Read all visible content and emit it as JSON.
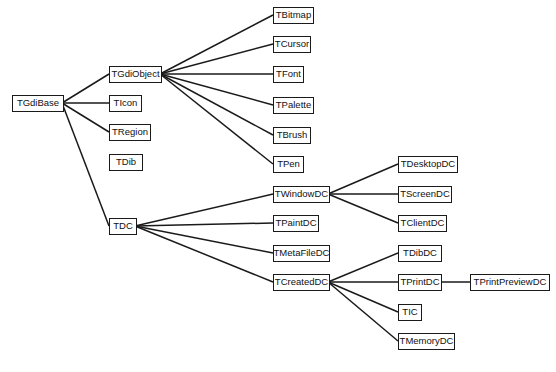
{
  "diagram": {
    "type": "class-hierarchy",
    "nodes": [
      {
        "id": "TGdiBase",
        "label": "TGdiBase",
        "x": 12,
        "y": 103,
        "w": 52
      },
      {
        "id": "TGdiObject",
        "label": "TGdiObject",
        "x": 109,
        "y": 74,
        "w": 53
      },
      {
        "id": "TIcon",
        "label": "TIcon",
        "x": 109,
        "y": 103,
        "w": 33
      },
      {
        "id": "TRegion",
        "label": "TRegion",
        "x": 109,
        "y": 132,
        "w": 42
      },
      {
        "id": "TDib",
        "label": "TDib",
        "x": 109,
        "y": 162,
        "w": 34
      },
      {
        "id": "TDC",
        "label": "TDC",
        "x": 109,
        "y": 226,
        "w": 28
      },
      {
        "id": "TBitmap",
        "label": "TBitmap",
        "x": 273,
        "y": 15,
        "w": 41
      },
      {
        "id": "TCursor",
        "label": "TCursor",
        "x": 273,
        "y": 44,
        "w": 38
      },
      {
        "id": "TFont",
        "label": "TFont",
        "x": 273,
        "y": 74,
        "w": 31
      },
      {
        "id": "TPalette",
        "label": "TPalette",
        "x": 273,
        "y": 105,
        "w": 41
      },
      {
        "id": "TBrush",
        "label": "TBrush",
        "x": 273,
        "y": 135,
        "w": 38
      },
      {
        "id": "TPen",
        "label": "TPen",
        "x": 273,
        "y": 164,
        "w": 31
      },
      {
        "id": "TWindowDC",
        "label": "TWindowDC",
        "x": 273,
        "y": 194,
        "w": 57
      },
      {
        "id": "TPaintDC",
        "label": "TPaintDC",
        "x": 273,
        "y": 223,
        "w": 46
      },
      {
        "id": "TMetaFileDC",
        "label": "TMetaFileDC",
        "x": 273,
        "y": 253,
        "w": 57
      },
      {
        "id": "TCreatedDC",
        "label": "TCreatedDC",
        "x": 273,
        "y": 282,
        "w": 57
      },
      {
        "id": "TDesktopDC",
        "label": "TDesktopDC",
        "x": 398,
        "y": 164,
        "w": 60
      },
      {
        "id": "TScreenDC",
        "label": "TScreenDC",
        "x": 398,
        "y": 194,
        "w": 54
      },
      {
        "id": "TClientDC",
        "label": "TClientDC",
        "x": 398,
        "y": 223,
        "w": 49
      },
      {
        "id": "TDibDC",
        "label": "TDibDC",
        "x": 398,
        "y": 253,
        "w": 44
      },
      {
        "id": "TPrintDC",
        "label": "TPrintDC",
        "x": 398,
        "y": 282,
        "w": 44
      },
      {
        "id": "TIC",
        "label": "TIC",
        "x": 398,
        "y": 312,
        "w": 24
      },
      {
        "id": "TMemoryDC",
        "label": "TMemoryDC",
        "x": 398,
        "y": 341,
        "w": 57
      },
      {
        "id": "TPrintPreviewDC",
        "label": "TPrintPreviewDC",
        "x": 470,
        "y": 282,
        "w": 80
      }
    ],
    "edges": [
      [
        "TGdiBase",
        "TGdiObject"
      ],
      [
        "TGdiBase",
        "TIcon"
      ],
      [
        "TGdiBase",
        "TRegion"
      ],
      [
        "TGdiBase",
        "TDC"
      ],
      [
        "TGdiObject",
        "TBitmap"
      ],
      [
        "TGdiObject",
        "TCursor"
      ],
      [
        "TGdiObject",
        "TFont"
      ],
      [
        "TGdiObject",
        "TPalette"
      ],
      [
        "TGdiObject",
        "TBrush"
      ],
      [
        "TGdiObject",
        "TPen"
      ],
      [
        "TDC",
        "TWindowDC"
      ],
      [
        "TDC",
        "TPaintDC"
      ],
      [
        "TDC",
        "TMetaFileDC"
      ],
      [
        "TDC",
        "TCreatedDC"
      ],
      [
        "TWindowDC",
        "TDesktopDC"
      ],
      [
        "TWindowDC",
        "TScreenDC"
      ],
      [
        "TWindowDC",
        "TClientDC"
      ],
      [
        "TCreatedDC",
        "TDibDC"
      ],
      [
        "TCreatedDC",
        "TPrintDC"
      ],
      [
        "TCreatedDC",
        "TIC"
      ],
      [
        "TCreatedDC",
        "TMemoryDC"
      ],
      [
        "TPrintDC",
        "TPrintPreviewDC"
      ]
    ],
    "colors": {
      "line": "#1a1a1a",
      "box_border": "#1a1a1a",
      "background": "#ffffff"
    }
  }
}
